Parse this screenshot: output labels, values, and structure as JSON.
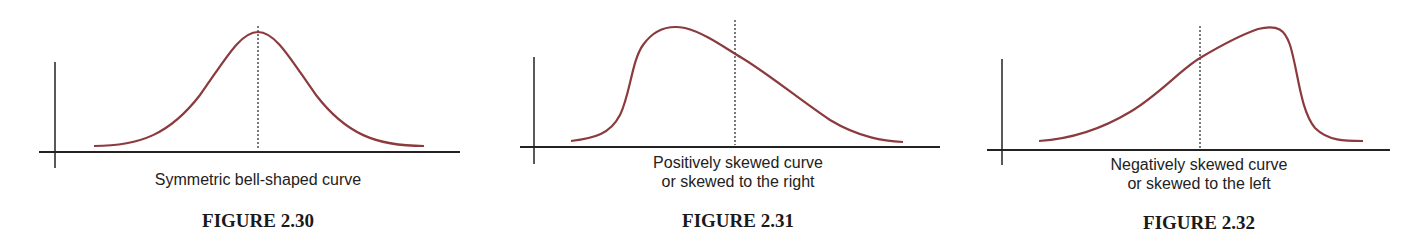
{
  "colors": {
    "curve": "#8b3a3e",
    "axis": "#222222",
    "text": "#222222"
  },
  "figures": [
    {
      "id": "2.30",
      "label": "FIGURE 2.30",
      "caption_line1": "Symmetric bell-shaped curve",
      "caption_line2": "",
      "shape": "symmetric"
    },
    {
      "id": "2.31",
      "label": "FIGURE 2.31",
      "caption_line1": "Positively skewed curve",
      "caption_line2": "or skewed to the right",
      "shape": "right-skewed"
    },
    {
      "id": "2.32",
      "label": "FIGURE 2.32",
      "caption_line1": "Negatively skewed curve",
      "caption_line2": "or skewed to the left",
      "shape": "left-skewed"
    }
  ]
}
